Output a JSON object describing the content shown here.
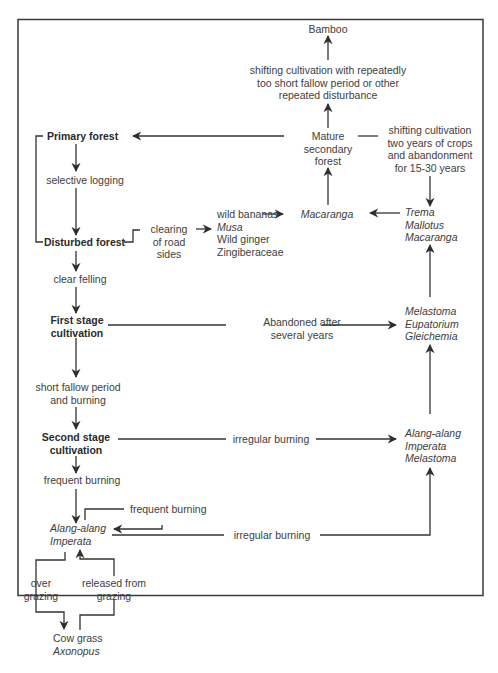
{
  "diagram": {
    "type": "succession-flowchart",
    "frame_color": "#3a3a3a",
    "line_color": "#333333",
    "nodes": {
      "bamboo": "Bamboo",
      "shifting_repeated": [
        "shifting cultivation with repeatedly",
        "too short fallow period or other",
        "repeated disturbance"
      ],
      "mature_secondary": [
        "Mature",
        "secondary",
        "forest"
      ],
      "shifting_two_years": [
        "shifting cultivation",
        "two years of crops",
        "and abandonment",
        "for 15-30 years"
      ],
      "primary_forest": "Primary forest",
      "selective_logging": "selective logging",
      "disturbed_forest": "Disturbed forest",
      "clearing_road": [
        "clearing",
        "of road",
        "sides"
      ],
      "wild_bananas_group": [
        "wild bananas",
        "Musa",
        "Wild ginger",
        "Zingiberaceae"
      ],
      "macaranga": "Macaranga",
      "trema_group": [
        "Trema",
        "Mallotus",
        "Macaranga"
      ],
      "clear_felling": "clear felling",
      "first_stage": [
        "First stage",
        "cultivation"
      ],
      "abandoned_after": [
        "Abandoned after",
        "several years"
      ],
      "melastoma_group": [
        "Melastoma",
        "Eupatorium",
        "Gleichemia"
      ],
      "short_fallow": [
        "short fallow period",
        "and burning"
      ],
      "second_stage": [
        "Second stage",
        "cultivation"
      ],
      "irregular_burning_1": "irregular burning",
      "alang_group_right": [
        "Alang-alang",
        "Imperata",
        "Melastoma"
      ],
      "frequent_burning_1": "frequent burning",
      "frequent_burning_loop": "frequent burning",
      "alang_left": [
        "Alang-alang",
        "Imperata"
      ],
      "irregular_burning_2": "irregular burning",
      "over_grazing": [
        "over",
        "grazing"
      ],
      "released_grazing": [
        "released from",
        "grazing"
      ],
      "cow_grass": [
        "Cow grass",
        "Axonopus"
      ]
    }
  }
}
